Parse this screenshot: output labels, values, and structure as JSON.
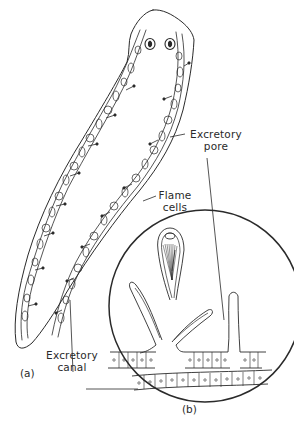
{
  "figure": {
    "type": "anatomical-diagram",
    "panels": [
      {
        "id": "a",
        "label": "(a)",
        "description": "Whole flatworm body with branching excretory canals"
      },
      {
        "id": "b",
        "label": "(b)",
        "description": "Magnified detail of flame cells and excretory canal"
      }
    ],
    "labels": {
      "excretory_pore": {
        "line1": "Excretory",
        "line2": "pore"
      },
      "flame_cells": {
        "line1": "Flame",
        "line2": "cells"
      },
      "excretory_canal": {
        "line1": "Excretory",
        "line2": "canal"
      }
    },
    "panel_a_label": "(a)",
    "panel_b_label": "(b)",
    "colors": {
      "ink": "#2a2a2a",
      "background": "#ffffff"
    }
  }
}
